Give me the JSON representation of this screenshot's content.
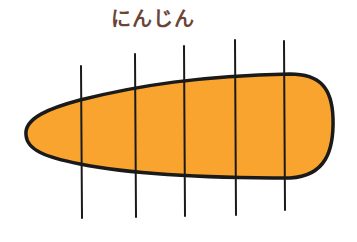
{
  "title": "にんじん",
  "colors": {
    "title": "#6b4438",
    "carrot_fill": "#f8a42e",
    "outline": "#1a1a1a"
  },
  "illustration": {
    "subject": "carrot",
    "cut_lines": 5
  }
}
